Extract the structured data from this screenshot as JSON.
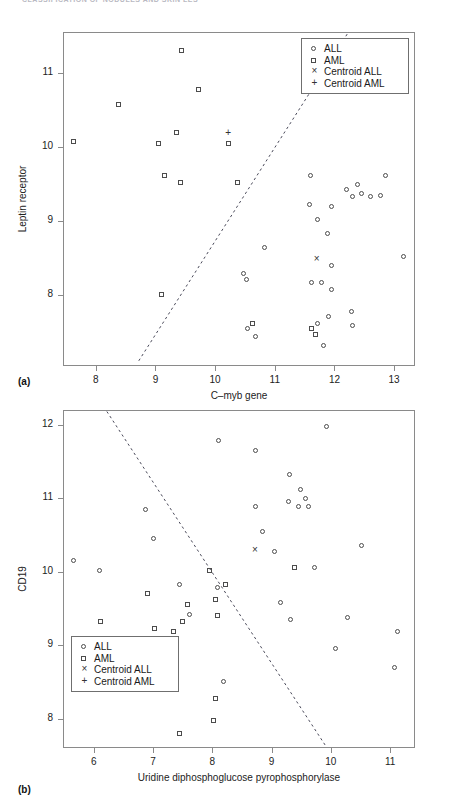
{
  "running_header": "CLASSIFICATION OF NODULES AND SKIN LES",
  "panels": [
    {
      "label": "(a)",
      "xlabel": "C–myb gene",
      "ylabel": "Leptin receptor",
      "xticks": [
        8,
        9,
        10,
        11,
        12,
        13
      ],
      "yticks": [
        8,
        9,
        10,
        11
      ],
      "legend": {
        "items": [
          {
            "glyph": "circle",
            "label": "ALL"
          },
          {
            "glyph": "square",
            "label": "AML"
          },
          {
            "glyph": "x",
            "label": "Centroid ALL"
          },
          {
            "glyph": "plus",
            "label": "Centroid AML"
          }
        ]
      }
    },
    {
      "label": "(b)",
      "xlabel": "Uridine diphosphoglucose pyrophosphorylase",
      "ylabel": "CD19",
      "xticks": [
        6,
        7,
        8,
        9,
        10,
        11
      ],
      "yticks": [
        8,
        9,
        10,
        11,
        12
      ],
      "legend": {
        "items": [
          {
            "glyph": "circle",
            "label": "ALL"
          },
          {
            "glyph": "square",
            "label": "AML"
          },
          {
            "glyph": "x",
            "label": "Centroid ALL"
          },
          {
            "glyph": "plus",
            "label": "Centroid AML"
          }
        ]
      }
    }
  ],
  "chart_data": [
    {
      "type": "scatter",
      "title": "(a)",
      "xlabel": "C–myb gene",
      "ylabel": "Leptin receptor",
      "xlim": [
        7.45,
        13.35
      ],
      "ylim": [
        7.05,
        11.55
      ],
      "xticks": [
        8,
        9,
        10,
        11,
        12,
        13
      ],
      "yticks": [
        8,
        9,
        10,
        11
      ],
      "grid": false,
      "legend_position": "upper-right",
      "series": [
        {
          "name": "ALL",
          "marker": "circle",
          "points": [
            [
              11.6,
              9.62
            ],
            [
              12.85,
              9.62
            ],
            [
              12.2,
              9.43
            ],
            [
              12.38,
              9.5
            ],
            [
              12.3,
              9.33
            ],
            [
              12.45,
              9.37
            ],
            [
              12.6,
              9.33
            ],
            [
              12.77,
              9.35
            ],
            [
              11.58,
              9.22
            ],
            [
              11.95,
              9.2
            ],
            [
              11.72,
              9.02
            ],
            [
              11.88,
              8.83
            ],
            [
              10.82,
              8.65
            ],
            [
              13.15,
              8.53
            ],
            [
              11.95,
              8.4
            ],
            [
              10.48,
              8.3
            ],
            [
              10.52,
              8.22
            ],
            [
              11.62,
              8.18
            ],
            [
              11.78,
              8.18
            ],
            [
              11.95,
              8.08
            ],
            [
              10.55,
              7.55
            ],
            [
              10.68,
              7.45
            ],
            [
              11.72,
              7.62
            ],
            [
              11.9,
              7.72
            ],
            [
              12.28,
              7.78
            ],
            [
              12.3,
              7.6
            ],
            [
              11.82,
              7.32
            ]
          ]
        },
        {
          "name": "AML",
          "marker": "square",
          "points": [
            [
              9.43,
              11.3
            ],
            [
              8.38,
              10.57
            ],
            [
              9.72,
              10.78
            ],
            [
              7.62,
              10.08
            ],
            [
              9.35,
              10.2
            ],
            [
              9.05,
              10.05
            ],
            [
              10.22,
              10.05
            ],
            [
              9.15,
              9.62
            ],
            [
              9.42,
              9.52
            ],
            [
              10.38,
              9.52
            ],
            [
              9.1,
              8.02
            ],
            [
              10.62,
              7.62
            ],
            [
              11.62,
              7.55
            ],
            [
              11.68,
              7.48
            ]
          ]
        },
        {
          "name": "Centroid ALL",
          "marker": "x",
          "points": [
            [
              11.7,
              8.5
            ]
          ]
        },
        {
          "name": "Centroid AML",
          "marker": "plus",
          "points": [
            [
              10.22,
              10.2
            ]
          ]
        }
      ],
      "annotations": [
        {
          "type": "line",
          "style": "dashed",
          "from": [
            8.72,
            7.12
          ],
          "to": [
            12.22,
            11.53
          ],
          "note": "linear decision boundary"
        }
      ]
    },
    {
      "type": "scatter",
      "title": "(b)",
      "xlabel": "Uridine diphosphoglucose pyrophosphorylase",
      "ylabel": "CD19",
      "xlim": [
        5.48,
        11.42
      ],
      "ylim": [
        7.6,
        12.2
      ],
      "xticks": [
        6,
        7,
        8,
        9,
        10,
        11
      ],
      "yticks": [
        8,
        9,
        10,
        11,
        12
      ],
      "grid": false,
      "legend_position": "lower-left",
      "series": [
        {
          "name": "ALL",
          "marker": "circle",
          "points": [
            [
              8.1,
              11.78
            ],
            [
              8.72,
              11.65
            ],
            [
              9.92,
              11.98
            ],
            [
              9.3,
              11.32
            ],
            [
              9.48,
              11.12
            ],
            [
              9.58,
              11.0
            ],
            [
              9.28,
              10.95
            ],
            [
              9.45,
              10.88
            ],
            [
              9.62,
              10.88
            ],
            [
              8.72,
              10.88
            ],
            [
              8.85,
              10.55
            ],
            [
              6.88,
              10.85
            ],
            [
              5.65,
              10.15
            ],
            [
              6.1,
              10.02
            ],
            [
              7.0,
              10.45
            ],
            [
              7.45,
              9.82
            ],
            [
              8.08,
              9.78
            ],
            [
              7.62,
              9.42
            ],
            [
              9.05,
              10.28
            ],
            [
              9.15,
              9.58
            ],
            [
              9.72,
              10.05
            ],
            [
              10.52,
              10.35
            ],
            [
              9.32,
              9.35
            ],
            [
              10.28,
              9.38
            ],
            [
              10.08,
              8.95
            ],
            [
              8.18,
              8.5
            ],
            [
              11.08,
              8.7
            ],
            [
              11.12,
              9.18
            ]
          ]
        },
        {
          "name": "AML",
          "marker": "square",
          "points": [
            [
              6.12,
              9.32
            ],
            [
              6.28,
              8.82
            ],
            [
              6.68,
              8.82
            ],
            [
              6.9,
              9.7
            ],
            [
              7.02,
              9.22
            ],
            [
              7.58,
              9.55
            ],
            [
              7.5,
              9.32
            ],
            [
              7.35,
              9.18
            ],
            [
              7.95,
              10.02
            ],
            [
              8.22,
              9.82
            ],
            [
              8.05,
              9.62
            ],
            [
              8.08,
              9.4
            ],
            [
              9.38,
              10.05
            ],
            [
              7.12,
              9.02
            ],
            [
              7.45,
              7.8
            ],
            [
              8.05,
              8.28
            ],
            [
              8.02,
              7.98
            ]
          ]
        },
        {
          "name": "Centroid ALL",
          "marker": "x",
          "points": [
            [
              8.72,
              10.3
            ]
          ]
        },
        {
          "name": "Centroid AML",
          "marker": "plus",
          "points": [
            [
              7.28,
              9.0
            ]
          ]
        }
      ],
      "annotations": [
        {
          "type": "line",
          "style": "dashed",
          "from": [
            6.22,
            12.18
          ],
          "to": [
            9.92,
            7.62
          ],
          "note": "linear decision boundary"
        }
      ]
    }
  ]
}
